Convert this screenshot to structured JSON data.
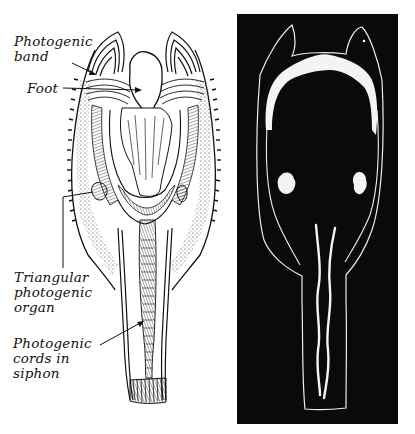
{
  "figure": {
    "left_panel": {
      "description": "Line drawing of the mollusk with labeled photogenic structures",
      "labels": [
        {
          "id": "photogenic_band",
          "text": "Photogenic\nband"
        },
        {
          "id": "foot",
          "text": "Foot"
        },
        {
          "id": "triangular_organ",
          "text": "Triangular\nphotogenic\norgan"
        },
        {
          "id": "photogenic_cords",
          "text": "Photogenic\ncords in\nsiphon"
        }
      ]
    },
    "right_panel": {
      "description": "Silhouette showing luminous organs glowing white on black background"
    },
    "colors": {
      "ink": "#111111",
      "paper": "#ffffff",
      "dark_panel": "#0a0a0a",
      "glow": "#f4f4f4"
    }
  }
}
